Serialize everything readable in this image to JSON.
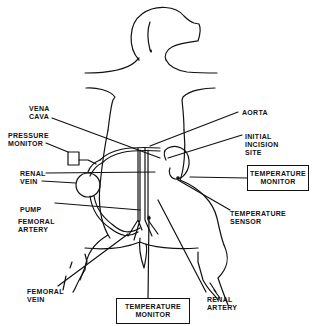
{
  "diagram": {
    "labels": {
      "vena_cava": [
        "VENA",
        "CAVA"
      ],
      "pressure_monitor": [
        "PRESSURE",
        "MONITOR"
      ],
      "renal_vein": [
        "RENAL",
        "VEIN"
      ],
      "pump": "PUMP",
      "femoral_artery": [
        "FEMORAL",
        "ARTERY"
      ],
      "femoral_vein": [
        "FEMORAL",
        "VEIN"
      ],
      "aorta": "AORTA",
      "initial_incision_site": [
        "INITIAL",
        "INCISION",
        "SITE"
      ],
      "temperature_sensor": [
        "TEMPERATURE",
        "SENSOR"
      ],
      "renal_artery": [
        "RENAL",
        "ARTERY"
      ]
    },
    "boxes": {
      "temperature_monitor_right": [
        "TEMPERATURE",
        "MONITOR"
      ],
      "temperature_monitor_bottom": [
        "TEMPERATURE",
        "MONITOR"
      ]
    },
    "colors": {
      "line": "#111111",
      "background": "#ffffff"
    }
  }
}
